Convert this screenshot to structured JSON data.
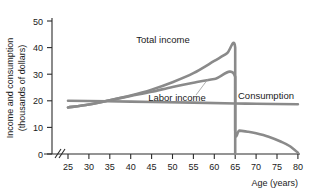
{
  "chart_data": {
    "type": "line",
    "title": "",
    "xlabel": "Age (years)",
    "ylabel": "Income and consumption (thousands of dollars)",
    "ylabel_line1": "Income and consumption",
    "ylabel_line2": "(thousands of dollars)",
    "xlim": [
      25,
      80
    ],
    "ylim": [
      0,
      50
    ],
    "xticks": [
      25,
      30,
      35,
      40,
      45,
      50,
      55,
      60,
      65,
      70,
      75,
      80
    ],
    "yticks": [
      0,
      10,
      20,
      30,
      40,
      50
    ],
    "xtick_labels": [
      "25",
      "30",
      "35",
      "40",
      "45",
      "50",
      "55",
      "60",
      "65",
      "70",
      "75",
      "80"
    ],
    "ytick_labels": [
      "0",
      "10",
      "20",
      "30",
      "40",
      "50"
    ],
    "grid": false,
    "legend": "inline-annotations",
    "axis_break_x": true,
    "line_color": "#8a8a8a",
    "axis_color": "#2b2b2b",
    "background": "#ffffff",
    "annotations": [
      {
        "name": "total-income",
        "text": "Total income",
        "x": 47.5,
        "y": 36.5
      },
      {
        "name": "labor-income",
        "text": "Labor income",
        "x": 52.0,
        "y": 20.8
      },
      {
        "name": "consumption",
        "text": "Consumption",
        "x": 70.5,
        "y": 21.6
      }
    ],
    "series": [
      {
        "name": "Total income",
        "color": "#8a8a8a",
        "x": [
          25,
          30,
          35,
          40,
          45,
          50,
          55,
          60,
          63,
          65,
          65,
          66,
          68,
          70,
          73,
          76,
          78,
          80
        ],
        "values": [
          17.5,
          18.6,
          20.2,
          22.0,
          24.2,
          27.0,
          30.4,
          35.0,
          37.8,
          40.0,
          9.0,
          8.8,
          8.4,
          7.8,
          6.5,
          4.6,
          3.0,
          0.5
        ]
      },
      {
        "name": "Labor income",
        "color": "#8a8a8a",
        "x": [
          25,
          30,
          35,
          40,
          45,
          50,
          55,
          60,
          65,
          65
        ],
        "values": [
          17.5,
          18.6,
          20.2,
          21.8,
          23.4,
          25.2,
          26.8,
          28.2,
          29.0,
          0.0
        ]
      },
      {
        "name": "Consumption",
        "color": "#8a8a8a",
        "x": [
          25,
          40,
          55,
          65,
          70,
          80
        ],
        "values": [
          20.0,
          19.7,
          19.3,
          19.0,
          18.9,
          18.7
        ]
      }
    ]
  }
}
